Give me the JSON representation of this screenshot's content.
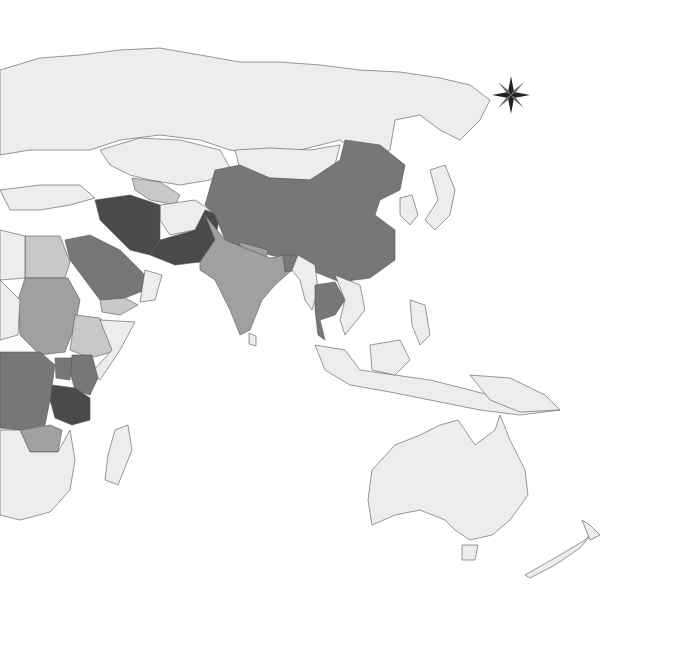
{
  "map": {
    "type": "choropleth",
    "projection": "eastern-hemisphere",
    "background": "#ffffff",
    "palette": {
      "none": "#ededed",
      "low": "#c8c8c8",
      "medium": "#a0a0a0",
      "high": "#777777",
      "very_high": "#4a4a4a"
    },
    "regions": [
      {
        "name": "Russia",
        "level": "none"
      },
      {
        "name": "Kazakhstan",
        "level": "none"
      },
      {
        "name": "Mongolia",
        "level": "none"
      },
      {
        "name": "China",
        "level": "high"
      },
      {
        "name": "India",
        "level": "medium"
      },
      {
        "name": "Pakistan",
        "level": "very_high"
      },
      {
        "name": "Iran",
        "level": "very_high"
      },
      {
        "name": "Afghanistan",
        "level": "none"
      },
      {
        "name": "Saudi Arabia",
        "level": "high"
      },
      {
        "name": "Yemen",
        "level": "low"
      },
      {
        "name": "Egypt",
        "level": "low"
      },
      {
        "name": "Sudan",
        "level": "medium"
      },
      {
        "name": "Ethiopia",
        "level": "low"
      },
      {
        "name": "Kenya",
        "level": "high"
      },
      {
        "name": "Tanzania",
        "level": "very_high"
      },
      {
        "name": "DR Congo",
        "level": "high"
      },
      {
        "name": "Zambia",
        "level": "medium"
      },
      {
        "name": "Uzbekistan",
        "level": "low"
      },
      {
        "name": "Thailand",
        "level": "high"
      },
      {
        "name": "Myanmar",
        "level": "none"
      },
      {
        "name": "Bangladesh",
        "level": "high"
      },
      {
        "name": "Nepal",
        "level": "medium"
      },
      {
        "name": "Australia",
        "level": "none"
      },
      {
        "name": "New Zealand",
        "level": "none"
      },
      {
        "name": "Indonesia",
        "level": "none"
      },
      {
        "name": "Japan",
        "level": "none"
      },
      {
        "name": "Korea",
        "level": "none"
      },
      {
        "name": "Madagascar",
        "level": "none"
      }
    ],
    "compass_rose": {
      "label": "north-compass-rose",
      "x": 511,
      "y": 95
    }
  }
}
